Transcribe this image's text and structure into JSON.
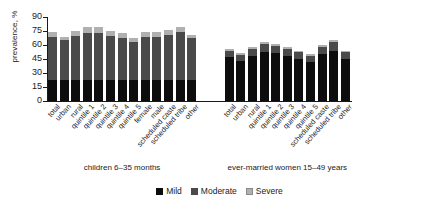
{
  "chart_data": {
    "type": "bar",
    "title": "",
    "subtitle": "",
    "xlabel": "",
    "ylabel": "prevalence, %",
    "ylim": [
      0,
      90
    ],
    "yticks": [
      0,
      15,
      30,
      45,
      60,
      75,
      90
    ],
    "grid": false,
    "stacked": true,
    "legend_position": "bottom-center",
    "legend": [
      "Mild",
      "Moderate",
      "Severe"
    ],
    "series_colors": {
      "Mild": "#0d0d0d",
      "Moderate": "#4a4a4a",
      "Severe": "#b0b0b0"
    },
    "groups": [
      {
        "caption": "children 6–35 months",
        "categories": [
          "total",
          "urban",
          "rural",
          "quintile 1",
          "quintile 2",
          "quintile 3",
          "quintile 4",
          "quintile 5",
          "female",
          "male",
          "scheduled caste",
          "scheduled tribe",
          "other"
        ],
        "series": [
          {
            "name": "Mild",
            "values": [
              23,
              23,
              23,
              23,
              23,
              23,
              23,
              22,
              23,
              23,
              23,
              23,
              23
            ]
          },
          {
            "name": "Moderate",
            "values": [
              46,
              42,
              47,
              50,
              50,
              47,
              45,
              41,
              46,
              46,
              48,
              51,
              44
            ]
          },
          {
            "name": "Severe",
            "values": [
              5,
              4,
              5,
              6,
              6,
              5,
              5,
              4,
              5,
              5,
              5,
              5,
              4
            ]
          }
        ],
        "totals": [
          74,
          69,
          75,
          79,
          79,
          75,
          73,
          67,
          74,
          74,
          76,
          79,
          71
        ]
      },
      {
        "caption": "ever-married women 15–49 years",
        "categories": [
          "total",
          "urban",
          "rural",
          "quintile 1",
          "quintile 2",
          "quintile 3",
          "quintile 4",
          "quintile 5",
          "scheduled caste",
          "scheduled tribe",
          "other"
        ],
        "series": [
          {
            "name": "Mild",
            "values": [
              47,
              43,
              48,
              52,
              51,
              48,
              45,
              42,
              50,
              54,
              45
            ]
          },
          {
            "name": "Moderate",
            "values": [
              7,
              6,
              8,
              9,
              8,
              8,
              7,
              6,
              8,
              9,
              7
            ]
          },
          {
            "name": "Severe",
            "values": [
              2,
              2,
              2,
              2,
              2,
              2,
              2,
              2,
              2,
              2,
              2
            ]
          }
        ],
        "totals": [
          56,
          51,
          58,
          63,
          61,
          58,
          54,
          50,
          60,
          65,
          54
        ]
      }
    ]
  }
}
